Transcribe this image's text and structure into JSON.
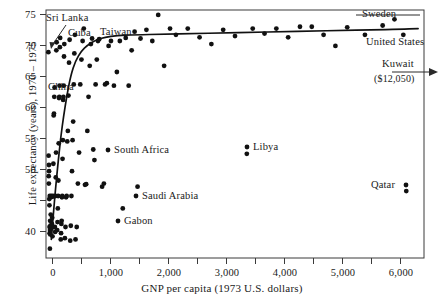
{
  "chart_data": {
    "type": "scatter",
    "title": "",
    "xlabel": "GNP per capita (1973 U.S. dollars)",
    "ylabel": "Life expectancy (years), 1970 – 1975",
    "xlim": [
      0,
      6400
    ],
    "ylim": [
      35,
      75
    ],
    "grid": false,
    "legend_position": "none",
    "x_major_ticks": [
      0,
      1000,
      2000,
      3000,
      4000,
      5000,
      6000
    ],
    "x_minor_ticks": [
      500,
      1500,
      2500,
      3500,
      4500,
      5500
    ],
    "x_tick_labels": [
      "0",
      "1,000",
      "2,000",
      "3,000",
      "4,000",
      "5,000",
      "6,000"
    ],
    "y_ticks": [
      40,
      45,
      50,
      55,
      60,
      65,
      70,
      75
    ],
    "y_tick_labels": [
      "40",
      "",
      "50",
      "55",
      "60",
      "65",
      "70",
      "75"
    ],
    "series": [
      {
        "name": "Countries",
        "marker": "filled-circle",
        "color": "#111111",
        "points": [
          [
            40,
            68.2
          ],
          [
            55,
            44.5
          ],
          [
            60,
            40.0
          ],
          [
            62,
            39.0
          ],
          [
            58,
            43.5
          ],
          [
            70,
            41.0
          ],
          [
            72,
            38.8
          ],
          [
            64,
            45.0
          ],
          [
            50,
            50.0
          ],
          [
            52,
            49.0
          ],
          [
            46,
            48.2
          ],
          [
            48,
            47.0
          ],
          [
            44,
            51.5
          ],
          [
            66,
            36.5
          ],
          [
            68,
            39.5
          ],
          [
            75,
            40.2
          ],
          [
            80,
            42.0
          ],
          [
            85,
            44.8
          ],
          [
            90,
            45.0
          ],
          [
            95,
            39.8
          ],
          [
            100,
            40.5
          ],
          [
            105,
            41.5
          ],
          [
            110,
            38.5
          ],
          [
            115,
            44.9
          ],
          [
            120,
            45.0
          ],
          [
            125,
            50.2
          ],
          [
            130,
            58.0
          ],
          [
            135,
            58.3
          ],
          [
            140,
            61.0
          ],
          [
            145,
            62.5
          ],
          [
            150,
            40.0
          ],
          [
            155,
            39.2
          ],
          [
            160,
            45.0
          ],
          [
            165,
            48.0
          ],
          [
            170,
            52.0
          ],
          [
            175,
            68.5
          ],
          [
            180,
            69.8
          ],
          [
            190,
            39.5
          ],
          [
            195,
            40.8
          ],
          [
            200,
            43.0
          ],
          [
            205,
            45.0
          ],
          [
            210,
            47.5
          ],
          [
            215,
            53.5
          ],
          [
            220,
            60.8
          ],
          [
            225,
            61.0
          ],
          [
            230,
            62.8
          ],
          [
            235,
            69.0
          ],
          [
            240,
            70.5
          ],
          [
            250,
            38.0
          ],
          [
            255,
            39.0
          ],
          [
            260,
            40.5
          ],
          [
            265,
            41.0
          ],
          [
            270,
            44.8
          ],
          [
            275,
            45.0
          ],
          [
            280,
            51.0
          ],
          [
            285,
            54.0
          ],
          [
            290,
            60.5
          ],
          [
            295,
            61.0
          ],
          [
            300,
            62.8
          ],
          [
            305,
            67.5
          ],
          [
            310,
            69.5
          ],
          [
            320,
            38.2
          ],
          [
            330,
            40.0
          ],
          [
            340,
            44.8
          ],
          [
            350,
            45.0
          ],
          [
            360,
            53.8
          ],
          [
            370,
            55.5
          ],
          [
            380,
            61.2
          ],
          [
            390,
            66.5
          ],
          [
            400,
            70.2
          ],
          [
            410,
            37.8
          ],
          [
            420,
            40.2
          ],
          [
            430,
            45.0
          ],
          [
            440,
            49.0
          ],
          [
            450,
            54.0
          ],
          [
            460,
            57.0
          ],
          [
            470,
            63.0
          ],
          [
            480,
            68.0
          ],
          [
            490,
            71.0
          ],
          [
            500,
            38.0
          ],
          [
            520,
            40.0
          ],
          [
            540,
            47.0
          ],
          [
            560,
            52.0
          ],
          [
            580,
            63.0
          ],
          [
            600,
            67.0
          ],
          [
            620,
            70.0
          ],
          [
            640,
            72.0
          ],
          [
            660,
            46.8
          ],
          [
            680,
            46.9
          ],
          [
            700,
            55.5
          ],
          [
            720,
            61.0
          ],
          [
            740,
            66.0
          ],
          [
            760,
            69.5
          ],
          [
            780,
            70.4
          ],
          [
            800,
            52.5
          ],
          [
            820,
            50.8
          ],
          [
            840,
            63.0
          ],
          [
            860,
            67.0
          ],
          [
            880,
            70.0
          ],
          [
            900,
            70.3
          ],
          [
            950,
            46.5
          ],
          [
            980,
            47.0
          ],
          [
            1000,
            63.0
          ],
          [
            1030,
            63.2
          ],
          [
            1060,
            69.2
          ],
          [
            1100,
            70.0
          ],
          [
            1150,
            62.8
          ],
          [
            1200,
            65.0
          ],
          [
            1250,
            70.0
          ],
          [
            1300,
            43.0
          ],
          [
            1350,
            70.5
          ],
          [
            1400,
            62.8
          ],
          [
            1450,
            68.5
          ],
          [
            1500,
            71.5
          ],
          [
            1550,
            46.5
          ],
          [
            1600,
            70.4
          ],
          [
            1700,
            71.8
          ],
          [
            1800,
            70.0
          ],
          [
            1900,
            74.2
          ],
          [
            2000,
            66.0
          ],
          [
            2100,
            72.0
          ],
          [
            2200,
            71.0
          ],
          [
            2400,
            72.0
          ],
          [
            2600,
            70.6
          ],
          [
            2800,
            69.5
          ],
          [
            3000,
            71.8
          ],
          [
            3200,
            70.8
          ],
          [
            3400,
            51.8
          ],
          [
            3500,
            72.0
          ],
          [
            3700,
            71.2
          ],
          [
            3900,
            72.0
          ],
          [
            4100,
            70.6
          ],
          [
            4300,
            72.3
          ],
          [
            4500,
            72.3
          ],
          [
            4700,
            71.0
          ],
          [
            4900,
            69.2
          ],
          [
            5100,
            72.2
          ],
          [
            5400,
            71.0
          ],
          [
            5700,
            72.5
          ],
          [
            5900,
            73.5
          ],
          [
            6050,
            71.0
          ],
          [
            6100,
            45.8
          ]
        ]
      }
    ],
    "fit_curve": {
      "name": "fitted-curve",
      "color": "#111111",
      "points": [
        [
          90,
          38.0
        ],
        [
          150,
          45.0
        ],
        [
          200,
          50.0
        ],
        [
          250,
          54.5
        ],
        [
          300,
          58.0
        ],
        [
          350,
          61.0
        ],
        [
          420,
          64.5
        ],
        [
          500,
          66.8
        ],
        [
          600,
          68.4
        ],
        [
          700,
          69.3
        ],
        [
          850,
          70.2
        ],
        [
          1000,
          70.6
        ],
        [
          1200,
          70.9
        ],
        [
          1500,
          71.0
        ],
        [
          2000,
          71.1
        ],
        [
          2500,
          71.2
        ],
        [
          3000,
          71.3
        ],
        [
          3500,
          71.4
        ],
        [
          4000,
          71.5
        ],
        [
          4500,
          71.6
        ],
        [
          5000,
          71.7
        ],
        [
          5500,
          71.8
        ],
        [
          6000,
          71.9
        ],
        [
          6300,
          72.0
        ]
      ]
    },
    "annotations": [
      {
        "id": "sri-lanka",
        "label": "Sri Lanka",
        "x_px": 46,
        "y_px": 14,
        "leader": "arrow-down-left"
      },
      {
        "id": "cuba",
        "label": "Cuba",
        "x_px": 68,
        "y_px": 29,
        "leader": "none"
      },
      {
        "id": "taiwan",
        "label": "Taiwan",
        "x_px": 100,
        "y_px": 28,
        "leader": "none"
      },
      {
        "id": "china",
        "label": "China",
        "x_px": 48,
        "y_px": 83,
        "leader": "none"
      },
      {
        "id": "south-africa",
        "label": "South Africa",
        "x_px": 112,
        "y_px": 148,
        "leader": "dot-left"
      },
      {
        "id": "saudi-arabia",
        "label": "Saudi Arabia",
        "x_px": 140,
        "y_px": 194,
        "leader": "dot-left"
      },
      {
        "id": "gabon",
        "label": "Gabon",
        "x_px": 122,
        "y_px": 219,
        "leader": "dot-left"
      },
      {
        "id": "libya",
        "label": "Libya",
        "x_px": 251,
        "y_px": 145,
        "leader": "dot-left"
      },
      {
        "id": "qatar",
        "label": "Qatar",
        "x_px": 371,
        "y_px": 182,
        "leader": "dot-right"
      },
      {
        "id": "sweden",
        "label": "Sweden",
        "x_px": 364,
        "y_px": 12,
        "leader": "line"
      },
      {
        "id": "united-states",
        "label": "United States",
        "x_px": 368,
        "y_px": 40,
        "leader": "none"
      },
      {
        "id": "kuwait",
        "label": "Kuwait",
        "x_px": 382,
        "y_px": 62,
        "leader": "arrow-right"
      },
      {
        "id": "kuwait-value",
        "label": "($12,050)",
        "x_px": 376,
        "y_px": 76,
        "leader": "none"
      }
    ]
  },
  "axes": {
    "y_title": "Life expectancy (years), 1970 – 1975",
    "x_title": "GNP per capita (1973 U.S. dollars)",
    "y_labels": [
      "75",
      "70",
      "65",
      "60",
      "55",
      "50",
      "40"
    ],
    "x_labels": [
      "0",
      "1,000",
      "2,000",
      "3,000",
      "4,000",
      "5,000",
      "6,000"
    ]
  },
  "colors": {
    "marker": "#111111",
    "curve": "#111111",
    "frame": "#3a3a3a",
    "text": "#1a1a1a",
    "background": "#ffffff"
  }
}
